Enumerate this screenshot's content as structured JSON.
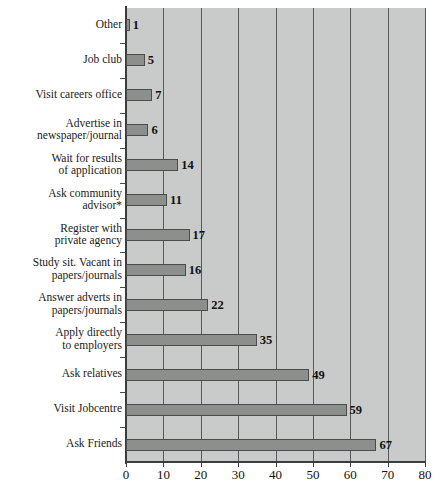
{
  "chart_data": {
    "type": "bar",
    "orientation": "horizontal",
    "title": "",
    "subtitle": "",
    "xlabel": "",
    "ylabel": "",
    "xlim": [
      0,
      80
    ],
    "xticks": [
      0,
      10,
      20,
      30,
      40,
      50,
      60,
      70,
      80
    ],
    "xtick_labels": [
      "0",
      "10",
      "20",
      "30",
      "40",
      "50",
      "60",
      "70",
      "80"
    ],
    "grid": "vertical",
    "legend": "none",
    "value_labels": true,
    "categories": [
      "Other",
      "Job club",
      "Visit careers office",
      "Advertise in\nnewspaper/journal",
      "Wait for results\nof application",
      "Ask community\nadvisor*",
      "Register with\nprivate agency",
      "Study sit. Vacant in\npapers/journals",
      "Answer adverts in\npapers/journals",
      "Apply directly\nto employers",
      "Ask relatives",
      "Visit Jobcentre",
      "Ask Friends"
    ],
    "values": [
      1,
      5,
      7,
      6,
      14,
      11,
      17,
      16,
      22,
      35,
      49,
      59,
      67
    ],
    "value_label_text": [
      "1",
      "5",
      "7",
      "6",
      "14",
      "11",
      "17",
      "16",
      "22",
      "35",
      "49",
      "59",
      "67"
    ],
    "colors": {
      "bar_fill": "#8d8f8d",
      "bar_stroke": "#4a4d4e",
      "plot_background": "#c8cbc9",
      "gridline": "#56595a",
      "axis": "#3a3d3e",
      "text": "#111111",
      "page_background": "#ffffff"
    },
    "footnote": "*"
  }
}
